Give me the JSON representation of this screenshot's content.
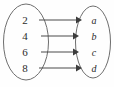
{
  "diagram": {
    "type": "mapping-diagram",
    "background_color": "#fefefe",
    "oval_stroke_color": "#6e6e6e",
    "arrow_color": "#3c3c3c",
    "text_color": "#2b2b2b",
    "domain_set": {
      "name": "domain-oval",
      "items": [
        {
          "label": "2"
        },
        {
          "label": "4"
        },
        {
          "label": "6"
        },
        {
          "label": "8"
        }
      ]
    },
    "codomain_set": {
      "name": "codomain-oval",
      "items": [
        {
          "label": "a"
        },
        {
          "label": "b"
        },
        {
          "label": "c"
        },
        {
          "label": "d"
        }
      ]
    },
    "arrows": [
      {
        "from": "2",
        "to": "a"
      },
      {
        "from": "4",
        "to": "b"
      },
      {
        "from": "6",
        "to": "c"
      },
      {
        "from": "8",
        "to": "d"
      }
    ]
  }
}
